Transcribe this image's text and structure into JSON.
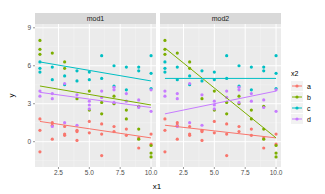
{
  "chart_data": {
    "type": "scatter",
    "title": "",
    "xlabel": "x1",
    "ylabel": "y",
    "xlim": [
      0.6,
      10.4
    ],
    "ylim": [
      -2.0,
      9.3
    ],
    "x_ticks": [
      2.5,
      5.0,
      7.5,
      10.0
    ],
    "x_tick_labels": [
      "2.5",
      "5.0",
      "7.5",
      "10.0"
    ],
    "y_ticks": [
      0,
      3,
      6,
      9
    ],
    "y_tick_labels": [
      "0",
      "3",
      "6",
      "9"
    ],
    "grid": true,
    "legend": {
      "title": "x2",
      "position": "right",
      "entries": [
        {
          "label": "a",
          "color": "#F8766D"
        },
        {
          "label": "b",
          "color": "#7CAE00"
        },
        {
          "label": "c",
          "color": "#00BFC4"
        },
        {
          "label": "d",
          "color": "#C77CFF"
        }
      ]
    },
    "facets": [
      {
        "label": "mod1",
        "lines": [
          {
            "group": "a",
            "x": [
              1,
              10
            ],
            "y": [
              1.6,
              0.3
            ]
          },
          {
            "group": "b",
            "x": [
              1,
              10
            ],
            "y": [
              4.4,
              2.9
            ]
          },
          {
            "group": "c",
            "x": [
              1,
              10
            ],
            "y": [
              6.3,
              4.8
            ]
          },
          {
            "group": "d",
            "x": [
              1,
              10
            ],
            "y": [
              3.9,
              2.7
            ]
          }
        ]
      },
      {
        "label": "mod2",
        "lines": [
          {
            "group": "a",
            "x": [
              1,
              10
            ],
            "y": [
              1.3,
              0.3
            ]
          },
          {
            "group": "b",
            "x": [
              1,
              10
            ],
            "y": [
              7.4,
              0.3
            ]
          },
          {
            "group": "c",
            "x": [
              1,
              10
            ],
            "y": [
              5.0,
              5.0
            ]
          },
          {
            "group": "d",
            "x": [
              1,
              10
            ],
            "y": [
              2.2,
              4.0
            ]
          }
        ]
      }
    ],
    "points": {
      "a": {
        "x": [
          1,
          1,
          1,
          2,
          2,
          2,
          3,
          3,
          3,
          4,
          4,
          4,
          5,
          5,
          6,
          6,
          6,
          7,
          7,
          8,
          8,
          9,
          9,
          10,
          10
        ],
        "y": [
          1.8,
          0.9,
          -0.8,
          1.5,
          1.3,
          0.2,
          1.2,
          0.6,
          0.5,
          0.9,
          0.1,
          0.8,
          1.6,
          0.7,
          1.4,
          0.6,
          -1.1,
          0.8,
          1.2,
          0.5,
          1.0,
          0.3,
          -0.5,
          0.6,
          -0.2
        ]
      },
      "b": {
        "x": [
          1,
          1,
          1,
          2,
          3,
          3,
          4,
          5,
          5,
          6,
          6,
          7,
          7,
          8,
          8,
          9,
          9,
          9,
          10,
          10,
          10
        ],
        "y": [
          8.0,
          7.3,
          6.9,
          7.0,
          6.3,
          5.8,
          3.4,
          4.0,
          2.5,
          3.1,
          2.2,
          3.0,
          3.6,
          1.8,
          2.5,
          1.0,
          0.2,
          2.8,
          -0.3,
          -1.2,
          -0.9
        ]
      },
      "c": {
        "x": [
          1,
          1,
          1,
          2,
          2,
          3,
          3,
          4,
          4,
          5,
          5,
          6,
          6,
          7,
          7,
          8,
          8,
          9,
          9,
          10,
          10,
          10
        ],
        "y": [
          6.3,
          5.8,
          5.5,
          5.9,
          4.9,
          5.2,
          4.5,
          5.6,
          4.8,
          5.5,
          4.9,
          6.8,
          5.0,
          4.4,
          6.0,
          5.9,
          4.1,
          5.9,
          5.6,
          6.8,
          5.4,
          4.2
        ]
      },
      "d": {
        "x": [
          1,
          1,
          2,
          2,
          2,
          3,
          3,
          4,
          4,
          5,
          5,
          5,
          6,
          6,
          7,
          7,
          7,
          8,
          8,
          9,
          9,
          10,
          10
        ],
        "y": [
          4.0,
          3.6,
          3.4,
          3.8,
          1.2,
          4.6,
          1.5,
          3.7,
          1.3,
          3.2,
          2.9,
          2.6,
          4.0,
          3.5,
          4.3,
          4.1,
          3.1,
          3.8,
          3.2,
          3.3,
          2.7,
          2.4,
          4.1
        ]
      }
    }
  }
}
